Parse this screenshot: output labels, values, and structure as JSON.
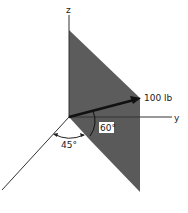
{
  "diagram": {
    "axes": {
      "z_label": "z",
      "y_label": "y"
    },
    "force": {
      "label": "100 lb"
    },
    "angles": {
      "vertical_angle": "60°",
      "horizontal_angle": "45°"
    },
    "colors": {
      "panel": "#5c5c5c",
      "line": "#222222",
      "background": "#ffffff"
    }
  }
}
